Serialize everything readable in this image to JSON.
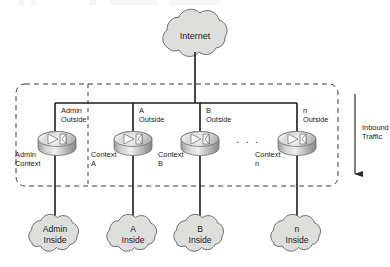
{
  "diagram": {
    "internet": {
      "label": "Internet",
      "name": "internet-cloud"
    },
    "boundary": {
      "name": "context-boundary-box",
      "style": "dashed"
    },
    "traffic_annotation": {
      "line1": "Inbound",
      "line2": "Traffic",
      "direction": "down"
    },
    "ellipsis": ". . .",
    "contexts": [
      {
        "id": "admin",
        "outside_line1": "Admin",
        "outside_line2": "Outside",
        "context_line1": "Admin",
        "context_line2": "Context",
        "inside_line1": "Admin",
        "inside_line2": "Inside"
      },
      {
        "id": "a",
        "outside_line1": "A",
        "outside_line2": "Outside",
        "context_line1": "Context",
        "context_line2": "A",
        "inside_line1": "A",
        "inside_line2": "Inside"
      },
      {
        "id": "b",
        "outside_line1": "B",
        "outside_line2": "Outside",
        "context_line1": "Context",
        "context_line2": "B",
        "inside_line1": "B",
        "inside_line2": "Inside"
      },
      {
        "id": "n",
        "outside_line1": "n",
        "outside_line2": "Outside",
        "context_line1": "Context",
        "context_line2": "n",
        "inside_line1": "n",
        "inside_line2": "Inside"
      }
    ],
    "colors": {
      "cloud_fill": "#dededd",
      "cloud_stroke": "#6f6f6f",
      "line": "#1b1b1b",
      "dashed": "#3a3a3a",
      "device_light": "#f2f2f2",
      "device_mid": "#bdbdbd",
      "device_dark": "#8a8a8a",
      "text": "#1b1b1b",
      "background": "#ffffff"
    }
  }
}
